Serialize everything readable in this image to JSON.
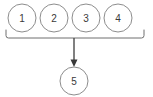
{
  "diagram": {
    "type": "flow-merge",
    "background_color": "#ffffff",
    "node_stroke_color": "#8d8d8d",
    "label_color": "#3a3a3a",
    "connector_color": "#4a4a4a",
    "bracket_color": "#6f6f6f",
    "source_nodes": [
      {
        "label": "1",
        "cx": 22,
        "cy": 18,
        "r": 14
      },
      {
        "label": "2",
        "cx": 54,
        "cy": 18,
        "r": 14
      },
      {
        "label": "3",
        "cx": 86,
        "cy": 18,
        "r": 14
      },
      {
        "label": "4",
        "cx": 118,
        "cy": 18,
        "r": 14
      }
    ],
    "target_node": {
      "label": "5",
      "cx": 74,
      "cy": 81,
      "r": 14
    },
    "bracket": {
      "left_x": 6,
      "right_x": 144,
      "line_y": 38,
      "tick_top_y": 30
    },
    "arrow": {
      "from_x": 74,
      "from_y": 38,
      "to_x": 74,
      "to_y": 67,
      "head_width": 7,
      "head_height": 7
    }
  }
}
